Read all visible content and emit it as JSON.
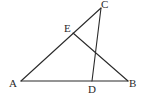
{
  "diagram": {
    "type": "geometry-triangle",
    "points": {
      "A": {
        "label": "A"
      },
      "B": {
        "label": "B"
      },
      "C": {
        "label": "C"
      },
      "D": {
        "label": "D",
        "on": "AB"
      },
      "E": {
        "label": "E",
        "on": "AC"
      }
    },
    "segments": [
      {
        "from": "A",
        "to": "B",
        "name": "segment-ab"
      },
      {
        "from": "A",
        "to": "C",
        "name": "segment-ac"
      },
      {
        "from": "C",
        "to": "D",
        "name": "segment-cd"
      },
      {
        "from": "E",
        "to": "B",
        "name": "segment-eb"
      }
    ]
  }
}
